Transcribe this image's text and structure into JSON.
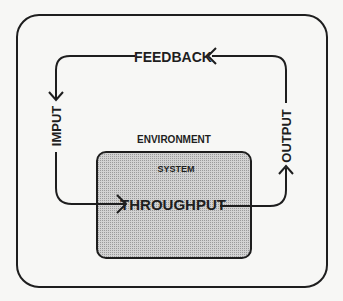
{
  "diagram": {
    "environment_label": "ENVIRONMENT",
    "system_label": "SYSTEM",
    "throughput_label": "THROUGHPUT",
    "input_label": "IMPUT",
    "output_label": "OUTPUT",
    "feedback_label": "FEEDBACK",
    "colors": {
      "background": "#f7f7f5",
      "stroke": "#1e1e1e",
      "system_fill": "#c4c4c4"
    }
  }
}
